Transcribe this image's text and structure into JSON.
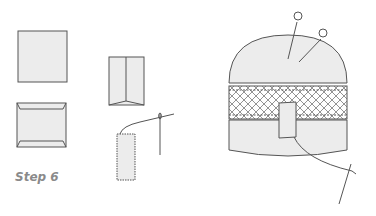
{
  "caption": {
    "step_label": "Step 6"
  },
  "colors": {
    "stroke": "#555555",
    "fill": "#ececec",
    "label": "#8a8a8a"
  },
  "figures": [
    {
      "name": "square-fabric",
      "description": "plain square"
    },
    {
      "name": "folded-edges",
      "description": "square with top and bottom edges folded"
    },
    {
      "name": "folded-center",
      "description": "panel folded into center"
    },
    {
      "name": "stitched-strip",
      "description": "narrow strip with stitching and needle"
    },
    {
      "name": "pincushion",
      "description": "dome pincushion with lattice band, pins, tab and needle"
    }
  ]
}
